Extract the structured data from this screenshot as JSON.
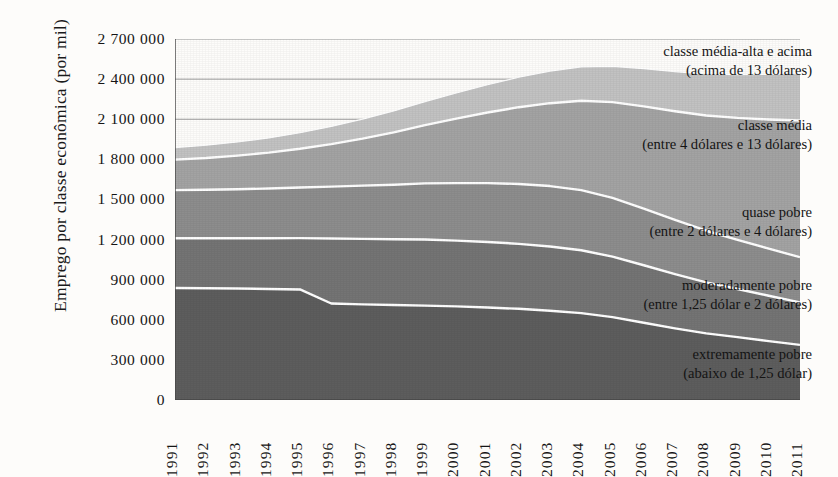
{
  "chart_data": {
    "type": "area",
    "stacked": true,
    "title": "",
    "xlabel": "",
    "ylabel": "Emprego por classe econômica (por mil)",
    "x": [
      1991,
      1992,
      1993,
      1994,
      1995,
      1996,
      1997,
      1998,
      1999,
      2000,
      2001,
      2002,
      2003,
      2004,
      2005,
      2006,
      2007,
      2008,
      2009,
      2010,
      2011
    ],
    "xtick_labels": [
      "1991",
      "1992",
      "1993",
      "1994",
      "1995",
      "1996",
      "1997",
      "1998",
      "1999",
      "2000",
      "2001",
      "2002",
      "2003",
      "2004",
      "2005",
      "2006",
      "2007",
      "2008",
      "2009",
      "2010",
      "2011"
    ],
    "ylim": [
      0,
      2700000
    ],
    "ytick_values": [
      0,
      300000,
      600000,
      900000,
      1200000,
      1500000,
      1800000,
      2100000,
      2400000,
      2700000
    ],
    "ytick_labels": [
      "0",
      "300 000",
      "600 000",
      "900 000",
      "1 200 000",
      "1 500 000",
      "1 800 000",
      "2 100 000",
      "2 400 000",
      "2 700 000"
    ],
    "grid": true,
    "gridlines_at": [
      2100000,
      2400000,
      2700000
    ],
    "legend_position": "inline-right",
    "series": [
      {
        "name": "extremamente pobre",
        "sublabel": "(abaixo de 1,25 dólar)",
        "color": "#5d5d5d",
        "values": [
          838000,
          836000,
          834000,
          830000,
          827000,
          722000,
          715000,
          710000,
          706000,
          700000,
          692000,
          682000,
          668000,
          650000,
          620000,
          578000,
          536000,
          498000,
          470000,
          440000,
          412000
        ]
      },
      {
        "name": "moderadamente pobre",
        "sublabel": "(entre 1,25 dólar e 2 dólares)",
        "color": "#747474",
        "values": [
          372000,
          374000,
          376000,
          380000,
          384000,
          486000,
          490000,
          492000,
          494000,
          492000,
          490000,
          486000,
          480000,
          470000,
          452000,
          430000,
          406000,
          382000,
          360000,
          340000,
          318000
        ]
      },
      {
        "name": "quase pobre",
        "sublabel": "(entre 2 dólares e 4 dólares)",
        "color": "#8d8d8d",
        "values": [
          360000,
          362000,
          366000,
          372000,
          378000,
          388000,
          398000,
          408000,
          420000,
          430000,
          440000,
          448000,
          452000,
          450000,
          440000,
          424000,
          406000,
          386000,
          368000,
          352000,
          338000
        ]
      },
      {
        "name": "classe média",
        "sublabel": "(entre 4 dólares e 13 dólares)",
        "color": "#a3a3a3",
        "values": [
          228000,
          238000,
          252000,
          268000,
          290000,
          318000,
          352000,
          392000,
          436000,
          482000,
          528000,
          574000,
          620000,
          668000,
          716000,
          764000,
          812000,
          862000,
          912000,
          966000,
          1022000
        ]
      },
      {
        "name": "classe média-alta e acima",
        "sublabel": "(acima de 13 dólares)",
        "color": "#c2c2c2",
        "values": [
          90000,
          96000,
          102000,
          110000,
          120000,
          132000,
          146000,
          160000,
          176000,
          192000,
          208000,
          224000,
          240000,
          254000,
          268000,
          282000,
          296000,
          310000,
          324000,
          338000,
          352000
        ]
      }
    ]
  },
  "axes": {
    "y_title": "Emprego por classe econômica (por mil)"
  },
  "style": {
    "background": "#fdfcfa",
    "axis_color": "#4a4a4a",
    "grid_color": "#9a9a9a",
    "separator_color": "#ffffff",
    "text_color": "#151515"
  }
}
